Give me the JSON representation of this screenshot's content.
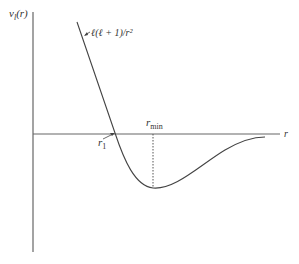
{
  "diagram": {
    "y_axis_label": {
      "main": "v",
      "sub": "l",
      "arg": "(r)"
    },
    "x_axis_label": "r",
    "curve_annotation": "ℓ(ℓ + 1)/r²",
    "r1_label": {
      "main": "r",
      "sub": "1"
    },
    "rmin_label": {
      "main": "r",
      "sub": "min"
    },
    "colors": {
      "axis": "#555555",
      "curve": "#444444",
      "text": "#333333"
    }
  }
}
